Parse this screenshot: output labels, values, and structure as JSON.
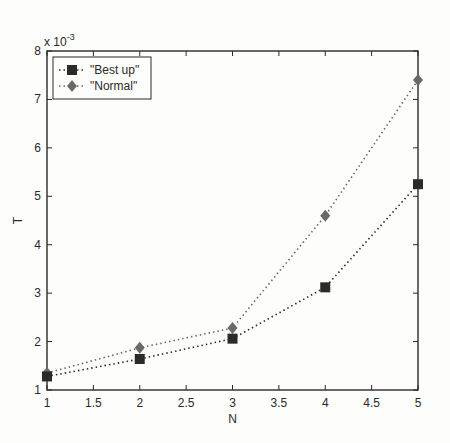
{
  "chart_data": {
    "type": "line",
    "title": "",
    "xlabel": "N",
    "ylabel": "T",
    "y_exponent_label": "x 10",
    "y_exponent": "-3",
    "xlim": [
      1,
      5
    ],
    "ylim": [
      1,
      8
    ],
    "x_ticks": [
      "1",
      "1.5",
      "2",
      "2.5",
      "3",
      "3.5",
      "4",
      "4.5",
      "5"
    ],
    "y_ticks": [
      "1",
      "2",
      "3",
      "4",
      "5",
      "6",
      "7",
      "8"
    ],
    "grid": false,
    "legend_position": "upper left",
    "x": [
      1,
      2,
      3,
      4,
      5
    ],
    "series": [
      {
        "name": "\"Best up\"",
        "marker": "square",
        "line_style": "dotted",
        "color": "#2b2b2b",
        "values": [
          1.28,
          1.64,
          2.06,
          3.12,
          5.25
        ]
      },
      {
        "name": "\"Normal\"",
        "marker": "diamond",
        "line_style": "dotted",
        "color": "#6a6a6a",
        "values": [
          1.35,
          1.87,
          2.28,
          4.6,
          7.4
        ]
      }
    ]
  }
}
